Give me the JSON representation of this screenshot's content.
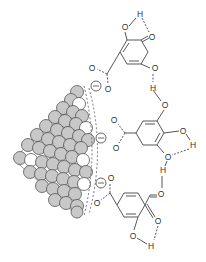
{
  "diagram": {
    "colors": {
      "particle_fill": "#c8c8c8",
      "particle_stroke": "#555555",
      "particle_highlight": "#ffffff",
      "line": "#444444",
      "background": "#ffffff"
    },
    "labels": {
      "oxygen": "O",
      "hydrogen": "H",
      "negative_charge": "−"
    },
    "charges": [
      {
        "x": 96,
        "y": 86
      },
      {
        "x": 100,
        "y": 138
      },
      {
        "x": 101,
        "y": 183
      }
    ],
    "molecules": [
      {
        "name": "top-molecule"
      },
      {
        "name": "middle-molecule"
      },
      {
        "name": "bottom-molecule"
      }
    ]
  }
}
